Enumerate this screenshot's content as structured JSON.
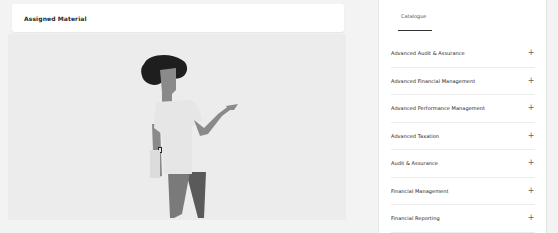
{
  "left_panel": {
    "title": "Assigned Material",
    "illustration": "woman-presenting-illustration"
  },
  "catalogue": {
    "tabs": [
      {
        "label": "Catalogue",
        "active": true
      }
    ],
    "items": [
      {
        "label": "Advanced Audit & Assurance",
        "icon": "plus-icon"
      },
      {
        "label": "Advanced Financial Management",
        "icon": "plus-icon"
      },
      {
        "label": "Advanced Performance Management",
        "icon": "plus-icon"
      },
      {
        "label": "Advanced Taxation",
        "icon": "plus-icon"
      },
      {
        "label": "Audit & Assurance",
        "icon": "plus-icon"
      },
      {
        "label": "Financial Management",
        "icon": "plus-icon"
      },
      {
        "label": "Financial Reporting",
        "icon": "plus-icon"
      }
    ],
    "expand_symbol": "+"
  },
  "colors": {
    "background": "#f3f3f3",
    "card": "#ffffff",
    "hair": "#1e1e1e",
    "skin": "#8a8a8a",
    "shirt": "#e8e8e8",
    "pants_front": "#7a7a7a",
    "pants_back": "#5a5a5a"
  }
}
